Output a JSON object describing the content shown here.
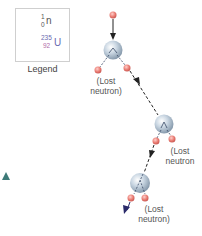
{
  "legend": {
    "caption": "Legend",
    "neutron": {
      "mass": "1",
      "charge": "0",
      "symbol": "n"
    },
    "uranium": {
      "mass": "235",
      "charge": "92",
      "symbol": "U"
    }
  },
  "labels": {
    "lost_neutron_1": [
      "(Lost",
      "neutron)"
    ],
    "lost_neutron_2": [
      "(Lost",
      "neutron"
    ],
    "lost_neutron_3": [
      "(Lost",
      "neutron)"
    ]
  },
  "colors": {
    "neutron": "#e8786f",
    "nucleus": "#b8c8d8",
    "arrow": "#222222",
    "final_arrow": "#2a2a6a",
    "triangle": "#3d7a78"
  }
}
